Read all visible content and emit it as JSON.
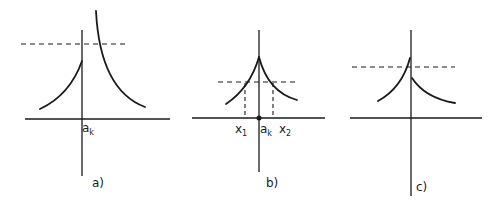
{
  "figure": {
    "panels": [
      {
        "id": "a",
        "caption": "a)",
        "axis_label": {
          "main": "a",
          "sub": "k"
        },
        "description": "Function discontinuous at a_k: left branch rises to a finite value, right branch diverges upward; horizontal dashed level line crosses only the right branch above the left limit."
      },
      {
        "id": "b",
        "caption": "b)",
        "axis_labels": [
          {
            "main": "x",
            "sub": "1"
          },
          {
            "main": "a",
            "sub": "k"
          },
          {
            "main": "x",
            "sub": "2"
          }
        ],
        "description": "Continuous cusp-shaped peak at a_k; dashed level line intersects both branches at x1 and x2, with vertical dashed projections to the axis and a dot at a_k."
      },
      {
        "id": "c",
        "caption": "c)",
        "description": "Jump discontinuity at the axis: left branch reaches higher than right branch; dashed level line lies between the two one-sided limits."
      }
    ],
    "colors": {
      "ink": "#1a1a1a",
      "background": "#ffffff"
    }
  }
}
